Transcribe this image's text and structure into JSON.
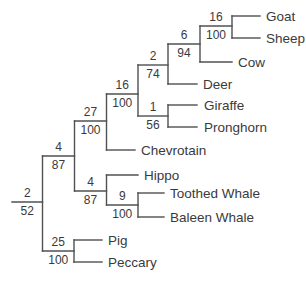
{
  "figure": {
    "kind": "phylogenetic-cladogram",
    "orientation": "left-to-right",
    "background": "#ffffff",
    "line_color": "#505052",
    "text_color": "#3a3a3c",
    "width": 306,
    "height": 282
  },
  "tree": {
    "newick": "(((((((Goat,Sheep)16/100,Cow)6/94,Deer)2/74,(Giraffe,Pronghorn)1/56)16/100,Chevrotain)27/100,(Hippo,(Toothed Whale,Baleen Whale)9/100)4/87)4/87,(Pig,Peccary)25/100)2/52",
    "taxa": [
      {
        "name": "Goat",
        "slug": "goat",
        "y": 16,
        "x1": 232,
        "x2": 260,
        "label_x": 266
      },
      {
        "name": "Sheep",
        "slug": "sheep",
        "y": 38,
        "x1": 232,
        "x2": 260,
        "label_x": 266
      },
      {
        "name": "Cow",
        "slug": "cow",
        "y": 62,
        "x1": 200,
        "x2": 232,
        "label_x": 238
      },
      {
        "name": "Deer",
        "slug": "deer",
        "y": 84,
        "x1": 168,
        "x2": 197,
        "label_x": 203
      },
      {
        "name": "Giraffe",
        "slug": "giraffe",
        "y": 105,
        "x1": 168,
        "x2": 197,
        "label_x": 204
      },
      {
        "name": "Pronghorn",
        "slug": "pronghorn",
        "y": 127,
        "x1": 168,
        "x2": 197,
        "label_x": 204
      },
      {
        "name": "Chevrotain",
        "slug": "chevrotain",
        "y": 150,
        "x1": 106.5,
        "x2": 135,
        "label_x": 141
      },
      {
        "name": "Hippo",
        "slug": "hippo",
        "y": 175,
        "x1": 106.5,
        "x2": 138,
        "label_x": 144
      },
      {
        "name": "Toothed Whale",
        "slug": "toothed-whale",
        "y": 193,
        "x1": 138,
        "x2": 164,
        "label_x": 170
      },
      {
        "name": "Baleen Whale",
        "slug": "baleen-whale",
        "y": 217,
        "x1": 138,
        "x2": 164,
        "label_x": 170
      },
      {
        "name": "Pig",
        "slug": "pig",
        "y": 240,
        "x1": 74,
        "x2": 102,
        "label_x": 108
      },
      {
        "name": "Peccary",
        "slug": "peccary",
        "y": 262,
        "x1": 74,
        "x2": 102,
        "label_x": 108
      }
    ],
    "clades": [
      {
        "slug": "root",
        "above": "2",
        "below": "52",
        "y": 202,
        "x1": 12,
        "x2": 42.5,
        "cy1": 156,
        "cy2": 251
      },
      {
        "slug": "non-suiform",
        "above": "4",
        "below": "87",
        "y": 156,
        "x1": 42.5,
        "x2": 74.5,
        "cy1": 121,
        "cy2": 191
      },
      {
        "slug": "ruminants",
        "above": "27",
        "below": "100",
        "y": 121,
        "x1": 74.5,
        "x2": 106.5,
        "cy1": 94,
        "cy2": 150
      },
      {
        "slug": "pecora",
        "above": "16",
        "below": "100",
        "y": 94,
        "x1": 106.5,
        "x2": 138,
        "cy1": 65,
        "cy2": 116
      },
      {
        "slug": "bovid-cervid",
        "above": "2",
        "below": "74",
        "y": 65,
        "x1": 138,
        "x2": 168,
        "cy1": 44,
        "cy2": 84
      },
      {
        "slug": "bovid-cow",
        "above": "6",
        "below": "94",
        "y": 44,
        "x1": 168,
        "x2": 200,
        "cy1": 26,
        "cy2": 62
      },
      {
        "slug": "goat-sheep",
        "above": "16",
        "below": "100",
        "y": 26,
        "x1": 200,
        "x2": 232,
        "cy1": 16,
        "cy2": 38
      },
      {
        "slug": "giraffe-pronghorn",
        "above": "1",
        "below": "56",
        "y": 116,
        "x1": 138,
        "x2": 168,
        "cy1": 105,
        "cy2": 127
      },
      {
        "slug": "whippomorpha",
        "above": "4",
        "below": "87",
        "y": 191,
        "x1": 74.5,
        "x2": 106.5,
        "cy1": 175,
        "cy2": 205
      },
      {
        "slug": "whales",
        "above": "9",
        "below": "100",
        "y": 205,
        "x1": 106.5,
        "x2": 138,
        "cy1": 193,
        "cy2": 217
      },
      {
        "slug": "pig-peccary",
        "above": "25",
        "below": "100",
        "y": 251,
        "x1": 42.5,
        "x2": 74,
        "cy1": 240,
        "cy2": 262
      }
    ]
  }
}
